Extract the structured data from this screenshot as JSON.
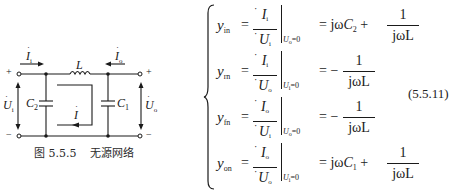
{
  "figure": {
    "caption_number": "图 5.5.5",
    "caption_title": "无源网络",
    "labels": {
      "input_current": "I",
      "input_current_sub": "i",
      "output_current": "I",
      "output_current_sub": "o",
      "inductor": "L",
      "capacitor_left": "C",
      "capacitor_left_sub": "2",
      "capacitor_right": "C",
      "capacitor_right_sub": "1",
      "loop_current": "I",
      "input_voltage": "U",
      "input_voltage_sub": "i",
      "output_voltage": "U",
      "output_voltage_sub": "o",
      "plus_left": "+",
      "minus_left": "−",
      "plus_right": "+",
      "minus_right": "−"
    }
  },
  "equations": {
    "number": "(5.5.11)",
    "rows": [
      {
        "lhs": "y",
        "lhs_sub": "in",
        "num": "I",
        "num_sub": "i",
        "den": "U",
        "den_sub": "i",
        "cond_var": "U",
        "cond_sub": "o",
        "cond_val": "=0",
        "rhs_prefix": "= jω",
        "rhs_c": "C",
        "rhs_c_sub": "2",
        "rhs_plus": "+",
        "rhs_frac_num": "1",
        "rhs_frac_den": "jωL"
      },
      {
        "lhs": "y",
        "lhs_sub": "rn",
        "num": "I",
        "num_sub": "i",
        "den": "U",
        "den_sub": "o",
        "cond_var": "U",
        "cond_sub": "i",
        "cond_val": "=0",
        "rhs_prefix": "= −",
        "rhs_frac_num": "1",
        "rhs_frac_den": "jωL"
      },
      {
        "lhs": "y",
        "lhs_sub": "fn",
        "num": "I",
        "num_sub": "o",
        "den": "U",
        "den_sub": "i",
        "cond_var": "U",
        "cond_sub": "o",
        "cond_val": "=0",
        "rhs_prefix": "= −",
        "rhs_frac_num": "1",
        "rhs_frac_den": "jωL"
      },
      {
        "lhs": "y",
        "lhs_sub": "on",
        "num": "I",
        "num_sub": "o",
        "den": "U",
        "den_sub": "o",
        "cond_var": "U",
        "cond_sub": "i",
        "cond_val": "=0",
        "rhs_prefix": "= jω",
        "rhs_c": "C",
        "rhs_c_sub": "1",
        "rhs_plus": "+",
        "rhs_frac_num": "1",
        "rhs_frac_den": "jωL"
      }
    ]
  }
}
